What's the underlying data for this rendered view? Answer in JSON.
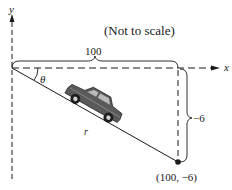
{
  "diagram": {
    "note": "(Not to scale)",
    "axes": {
      "x_label": "x",
      "y_label": "y",
      "style": "dashed"
    },
    "horizontal_distance": {
      "label": "100"
    },
    "vertical_distance": {
      "label": "−6"
    },
    "angle": {
      "label": "θ"
    },
    "hypotenuse": {
      "label": "r"
    },
    "endpoint": {
      "label": "(100, −6)",
      "x": 100,
      "y": -6
    },
    "object": {
      "icon": "car-icon",
      "description": "car driving down slope"
    },
    "colors": {
      "ink": "#1a1a1a",
      "car_body": "#5a5a5a",
      "background": "#ffffff"
    }
  }
}
